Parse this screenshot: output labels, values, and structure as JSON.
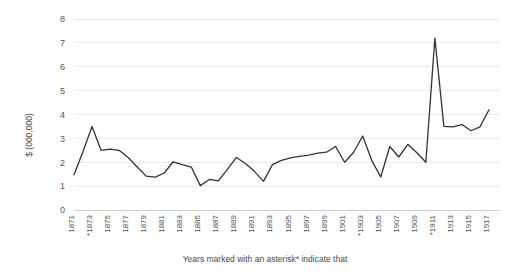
{
  "chart_data": {
    "type": "line",
    "title": "",
    "subtitle": "",
    "xlabel": "",
    "ylabel": "$ (000,000)",
    "ylim": [
      0,
      8
    ],
    "xlim": [
      1871,
      1917
    ],
    "grid": true,
    "legend": false,
    "legend_position": "none",
    "line_color": "#333333",
    "grid_color": "#e9e9e9",
    "y_ticks": [
      "0",
      "1",
      "2",
      "3",
      "4",
      "5",
      "6",
      "7",
      "8"
    ],
    "x_tick_labels": [
      "1871",
      "*1873",
      "1875",
      "1877",
      "1879",
      "1881",
      "1883",
      "1885",
      "1887",
      "1889",
      "1891",
      "1893",
      "1895",
      "1897",
      "1899",
      "1901",
      "*1903",
      "1905",
      "1907",
      "1909",
      "*1911",
      "1913",
      "1915",
      "1917"
    ],
    "asterisk_years": [
      1873,
      1903,
      1911
    ],
    "annotation": "Years marked with an asterisk* indicate that",
    "x": [
      1871,
      1872,
      1873,
      1874,
      1875,
      1876,
      1877,
      1878,
      1879,
      1880,
      1881,
      1882,
      1883,
      1884,
      1885,
      1886,
      1887,
      1888,
      1889,
      1890,
      1891,
      1892,
      1893,
      1894,
      1895,
      1896,
      1897,
      1898,
      1899,
      1900,
      1901,
      1902,
      1903,
      1904,
      1905,
      1906,
      1907,
      1908,
      1909,
      1910,
      1911,
      1912,
      1913,
      1914,
      1915,
      1916,
      1917
    ],
    "series": [
      {
        "name": "value",
        "values": [
          1.48,
          2.45,
          3.5,
          2.5,
          2.55,
          2.5,
          2.2,
          1.8,
          1.42,
          1.38,
          1.55,
          2.02,
          1.9,
          1.8,
          1.02,
          1.28,
          1.22,
          1.7,
          2.2,
          1.95,
          1.62,
          1.2,
          1.9,
          2.08,
          2.18,
          2.25,
          2.3,
          2.38,
          2.42,
          2.66,
          2.0,
          2.42,
          3.1,
          2.08,
          1.38,
          2.66,
          2.22,
          2.75,
          2.4,
          2.0,
          7.2,
          3.5,
          3.48,
          3.58,
          3.32,
          3.48,
          4.2
        ]
      }
    ]
  }
}
